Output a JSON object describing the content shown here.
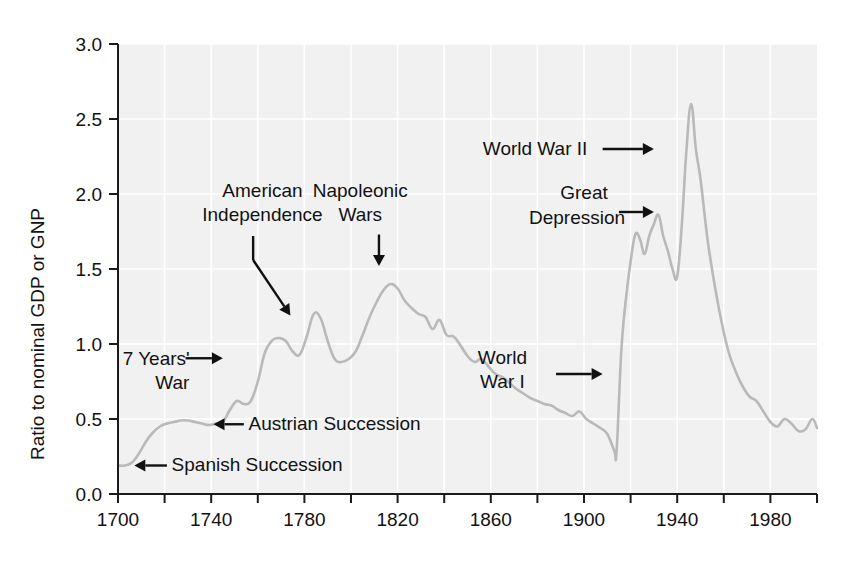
{
  "chart_data": {
    "type": "line",
    "title": "",
    "xlabel": "",
    "ylabel": "Ratio to nominal GDP or GNP",
    "xlim": [
      1700,
      2000
    ],
    "ylim": [
      0.0,
      3.0
    ],
    "grid": true,
    "legend": "none",
    "line_color": "#b9b9b9",
    "background_color": "#f1f1f1",
    "x_ticks_major": [
      "1700",
      "1740",
      "1780",
      "1820",
      "1860",
      "1900",
      "1940",
      "1980"
    ],
    "x_ticks_major_values": [
      1700,
      1740,
      1780,
      1820,
      1860,
      1900,
      1940,
      1980
    ],
    "x_ticks_minor_values": [
      1720,
      1760,
      1800,
      1840,
      1880,
      1920,
      1960,
      2000
    ],
    "y_ticks": [
      "0.0",
      "0.5",
      "1.0",
      "1.5",
      "2.0",
      "2.5",
      "3.0"
    ],
    "y_tick_values": [
      0.0,
      0.5,
      1.0,
      1.5,
      2.0,
      2.5,
      3.0
    ],
    "series": [
      {
        "name": "UK public debt to GDP ratio",
        "x": [
          1700,
          1703,
          1706,
          1709,
          1712,
          1715,
          1718,
          1721,
          1724,
          1727,
          1730,
          1733,
          1736,
          1739,
          1742,
          1745,
          1748,
          1751,
          1754,
          1757,
          1760,
          1763,
          1766,
          1769,
          1772,
          1775,
          1778,
          1781,
          1784,
          1787,
          1790,
          1793,
          1796,
          1799,
          1802,
          1805,
          1808,
          1811,
          1814,
          1817,
          1820,
          1823,
          1826,
          1829,
          1832,
          1835,
          1838,
          1841,
          1844,
          1847,
          1850,
          1853,
          1856,
          1859,
          1862,
          1865,
          1868,
          1871,
          1874,
          1877,
          1880,
          1883,
          1886,
          1889,
          1892,
          1895,
          1898,
          1901,
          1904,
          1907,
          1910,
          1913,
          1914,
          1916,
          1918,
          1920,
          1922,
          1924,
          1926,
          1928,
          1930,
          1932,
          1934,
          1936,
          1938,
          1940,
          1942,
          1944,
          1946,
          1948,
          1950,
          1953,
          1956,
          1959,
          1962,
          1965,
          1968,
          1971,
          1974,
          1977,
          1980,
          1983,
          1986,
          1989,
          1992,
          1995,
          1998,
          2000
        ],
        "y": [
          0.19,
          0.19,
          0.21,
          0.27,
          0.35,
          0.41,
          0.45,
          0.47,
          0.48,
          0.49,
          0.49,
          0.48,
          0.47,
          0.46,
          0.47,
          0.48,
          0.56,
          0.62,
          0.6,
          0.62,
          0.75,
          0.94,
          1.02,
          1.04,
          1.02,
          0.95,
          0.93,
          1.05,
          1.2,
          1.17,
          1.02,
          0.9,
          0.88,
          0.9,
          0.95,
          1.06,
          1.18,
          1.28,
          1.36,
          1.4,
          1.37,
          1.29,
          1.24,
          1.2,
          1.18,
          1.1,
          1.16,
          1.06,
          1.05,
          0.99,
          0.92,
          0.88,
          0.9,
          0.85,
          0.8,
          0.78,
          0.74,
          0.7,
          0.67,
          0.64,
          0.62,
          0.6,
          0.59,
          0.56,
          0.54,
          0.52,
          0.55,
          0.5,
          0.47,
          0.44,
          0.4,
          0.29,
          0.29,
          0.95,
          1.3,
          1.55,
          1.73,
          1.7,
          1.6,
          1.72,
          1.8,
          1.86,
          1.72,
          1.62,
          1.5,
          1.45,
          1.8,
          2.3,
          2.6,
          2.3,
          2.1,
          1.7,
          1.4,
          1.15,
          0.95,
          0.82,
          0.72,
          0.65,
          0.62,
          0.55,
          0.48,
          0.45,
          0.5,
          0.47,
          0.42,
          0.43,
          0.5,
          0.44
        ],
        "color": "#b9b9b9"
      }
    ],
    "annotations": [
      {
        "id": "spanish-succession",
        "label": "Spanish Succession",
        "label_x": 1705,
        "label_y": 0.17,
        "arrow": "left",
        "points_to_year": 1710,
        "points_to_value": 0.28
      },
      {
        "id": "austrian-succession",
        "label": "Austrian Succession",
        "label_x": 1745,
        "label_y": 0.5,
        "arrow": "left",
        "points_to_year": 1744,
        "points_to_value": 0.55
      },
      {
        "id": "seven-years-war",
        "label": "7 Years' War",
        "label_line1": "7 Years'",
        "label_line2": "War",
        "label_x": 1706,
        "label_y": 0.85,
        "arrow": "right",
        "points_to_year": 1758,
        "points_to_value": 0.85
      },
      {
        "id": "american-independence",
        "label": "American Independence",
        "label_line1": "American",
        "label_line2": "Independence",
        "label_x": 1748,
        "label_y": 1.95,
        "arrow": "diagonal-down-right",
        "points_to_year": 1778,
        "points_to_value": 1.1
      },
      {
        "id": "napoleonic-wars",
        "label": "Napoleonic Wars",
        "label_line1": "Napoleonic",
        "label_line2": "Wars",
        "label_x": 1800,
        "label_y": 1.95,
        "arrow": "down",
        "points_to_year": 1812,
        "points_to_value": 1.45
      },
      {
        "id": "world-war-i",
        "label": "World War I",
        "label_line1": "World",
        "label_line2": "War I",
        "label_x": 1880,
        "label_y": 0.85,
        "arrow": "right",
        "points_to_year": 1914,
        "points_to_value": 0.78
      },
      {
        "id": "great-depression",
        "label": "Great Depression",
        "label_line1": "Great",
        "label_line2": "Depression",
        "label_x": 1880,
        "label_y": 1.95,
        "arrow": "right",
        "points_to_year": 1932,
        "points_to_value": 1.86
      },
      {
        "id": "world-war-ii",
        "label": "World War II",
        "label_x": 1885,
        "label_y": 2.3,
        "arrow": "right",
        "points_to_year": 1944,
        "points_to_value": 2.3
      }
    ]
  }
}
